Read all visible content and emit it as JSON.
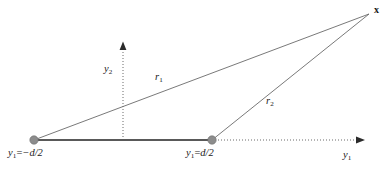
{
  "figure": {
    "kind": "geometry-diagram",
    "background_color": "#ffffff",
    "line_color": "#555555",
    "node_color": "#8c8c8c",
    "text_color": "#1a1a1a",
    "width": 389,
    "height": 173
  },
  "labels": {
    "source_left": {
      "var": "y",
      "sub": "1",
      "equals": "=",
      "value": "−d/2",
      "full": "y₁=−d/2"
    },
    "source_right": {
      "var": "y",
      "sub": "1",
      "equals": "=",
      "value": "d/2",
      "full": "y₁=d/2"
    },
    "axis_horizontal": {
      "var": "y",
      "sub": "1",
      "full": "y₁"
    },
    "axis_vertical": {
      "var": "y",
      "sub": "2",
      "full": "y₂"
    },
    "ray_one": {
      "var": "r",
      "sub": "1",
      "full": "r₁"
    },
    "ray_two": {
      "var": "r",
      "sub": "2",
      "full": "r₂"
    },
    "field_point": {
      "var": "x",
      "full": "x"
    }
  },
  "geometry": {
    "origin": {
      "x": 123,
      "y": 140
    },
    "source_left_point": {
      "x": 34,
      "y": 140
    },
    "source_right_point": {
      "x": 212,
      "y": 140
    },
    "field_point": {
      "x": 370,
      "y": 13
    },
    "horizontal_axis_arrow_tip": {
      "x": 364,
      "y": 140
    },
    "vertical_axis_arrow_tip": {
      "x": 123,
      "y": 42
    },
    "node_radius": 4.2,
    "baseline_stroke_width": 2.0,
    "ray_stroke_width": 0.9,
    "axis_dash_pattern": "1,2"
  }
}
